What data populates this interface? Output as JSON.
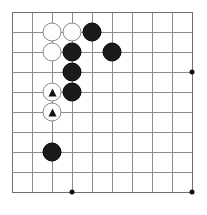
{
  "figure": {
    "kind": "go-board-diagram",
    "caption": "",
    "colors": {
      "background": "#ffffff",
      "grid_line": "#8d8d8d",
      "edge_line": "#6f6f6f",
      "black_stone": "#1b1b1b",
      "white_stone": "#fdfdfd",
      "white_stone_border": "#8a8a8a",
      "mark": "#111111",
      "caption_text": "#9a9a9a"
    }
  },
  "board": {
    "columns": 10,
    "rows": 10,
    "origin_x": 12,
    "origin_y": 12,
    "spacing": 20,
    "column_lines": [
      12,
      32,
      52,
      72,
      92,
      112,
      132,
      152,
      172,
      192
    ],
    "row_lines": [
      12,
      32,
      52,
      72,
      92,
      112,
      132,
      152,
      172,
      192
    ],
    "star_points": [
      {
        "label": "star-point-right",
        "col": 10,
        "row": 4,
        "x": 192,
        "y": 72
      },
      {
        "label": "star-point-bottom",
        "col": 4,
        "row": 10,
        "x": 72,
        "y": 192
      },
      {
        "label": "star-point-bottom-right",
        "col": 10,
        "row": 10,
        "x": 192,
        "y": 192
      }
    ],
    "stones": [
      {
        "id": "w1",
        "color": "white",
        "mark": "",
        "col": 3,
        "row": 2,
        "x": 52,
        "y": 32
      },
      {
        "id": "w2",
        "color": "white",
        "mark": "",
        "col": 4,
        "row": 2,
        "x": 72,
        "y": 32
      },
      {
        "id": "b1",
        "color": "black",
        "mark": "",
        "col": 5,
        "row": 2,
        "x": 92,
        "y": 32
      },
      {
        "id": "w3",
        "color": "white",
        "mark": "",
        "col": 3,
        "row": 3,
        "x": 52,
        "y": 52
      },
      {
        "id": "b2",
        "color": "black",
        "mark": "",
        "col": 4,
        "row": 3,
        "x": 72,
        "y": 52
      },
      {
        "id": "b3",
        "color": "black",
        "mark": "",
        "col": 6,
        "row": 3,
        "x": 112,
        "y": 52
      },
      {
        "id": "b4",
        "color": "black",
        "mark": "",
        "col": 4,
        "row": 4,
        "x": 72,
        "y": 72
      },
      {
        "id": "w4",
        "color": "white",
        "mark": "triangle",
        "col": 3,
        "row": 5,
        "x": 52,
        "y": 92
      },
      {
        "id": "b5",
        "color": "black",
        "mark": "",
        "col": 4,
        "row": 5,
        "x": 72,
        "y": 92
      },
      {
        "id": "w5",
        "color": "white",
        "mark": "triangle",
        "col": 3,
        "row": 6,
        "x": 52,
        "y": 112
      },
      {
        "id": "b6",
        "color": "black",
        "mark": "",
        "col": 3,
        "row": 8,
        "x": 52,
        "y": 152
      }
    ]
  }
}
